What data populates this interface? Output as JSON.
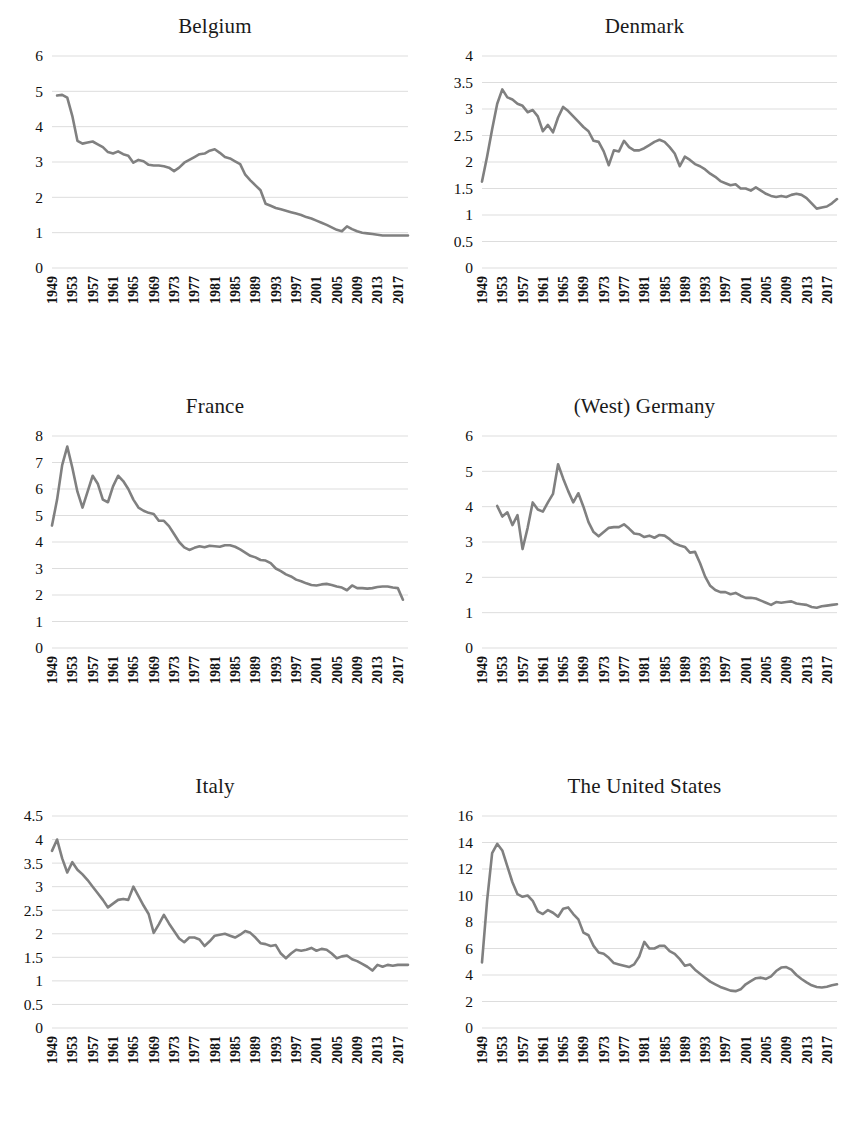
{
  "figure": {
    "layout": "2 columns x 3 rows of line charts",
    "line_color": "#808080",
    "grid_color": "#d9d9d9",
    "background": "#ffffff"
  },
  "chart_data": [
    {
      "type": "line",
      "title": "Belgium",
      "xlabel": "",
      "ylabel": "",
      "ylim": [
        0,
        6
      ],
      "ytick_step": 1,
      "yticks": [
        "0",
        "1",
        "2",
        "3",
        "4",
        "5",
        "6"
      ],
      "xlim": [
        1949,
        2019
      ],
      "xticks": [
        "1949",
        "1953",
        "1957",
        "1961",
        "1965",
        "1969",
        "1973",
        "1977",
        "1981",
        "1985",
        "1989",
        "1993",
        "1997",
        "2001",
        "2005",
        "2009",
        "2013",
        "2017"
      ],
      "grid": true,
      "legend": "none",
      "x": [
        1950,
        1951,
        1952,
        1953,
        1954,
        1955,
        1956,
        1957,
        1958,
        1959,
        1960,
        1961,
        1962,
        1963,
        1964,
        1965,
        1966,
        1967,
        1968,
        1969,
        1970,
        1971,
        1972,
        1973,
        1974,
        1975,
        1976,
        1977,
        1978,
        1979,
        1980,
        1981,
        1982,
        1983,
        1984,
        1985,
        1986,
        1987,
        1988,
        1989,
        1990,
        1991,
        1992,
        1993,
        1994,
        1995,
        1996,
        1997,
        1998,
        1999,
        2000,
        2001,
        2002,
        2003,
        2004,
        2005,
        2006,
        2007,
        2008,
        2009,
        2010,
        2011,
        2012,
        2013,
        2014,
        2015,
        2016,
        2017,
        2018,
        2019
      ],
      "values": [
        4.88,
        4.9,
        4.82,
        4.3,
        3.6,
        3.52,
        3.55,
        3.58,
        3.5,
        3.42,
        3.28,
        3.24,
        3.3,
        3.22,
        3.18,
        2.98,
        3.06,
        3.02,
        2.92,
        2.9,
        2.9,
        2.88,
        2.84,
        2.74,
        2.84,
        2.98,
        3.06,
        3.14,
        3.22,
        3.24,
        3.32,
        3.36,
        3.26,
        3.14,
        3.1,
        3.02,
        2.94,
        2.64,
        2.48,
        2.34,
        2.2,
        1.82,
        1.76,
        1.7,
        1.66,
        1.62,
        1.58,
        1.54,
        1.5,
        1.44,
        1.4,
        1.34,
        1.28,
        1.22,
        1.15,
        1.08,
        1.04,
        1.18,
        1.1,
        1.04,
        1.0,
        0.98,
        0.96,
        0.94,
        0.92,
        0.92,
        0.92,
        0.92,
        0.92,
        0.92
      ]
    },
    {
      "type": "line",
      "title": "Denmark",
      "xlabel": "",
      "ylabel": "",
      "ylim": [
        0,
        4
      ],
      "ytick_step": 0.5,
      "yticks": [
        "0",
        "0.5",
        "1",
        "1.5",
        "2",
        "2.5",
        "3",
        "3.5",
        "4"
      ],
      "xlim": [
        1949,
        2019
      ],
      "xticks": [
        "1949",
        "1953",
        "1957",
        "1961",
        "1965",
        "1969",
        "1973",
        "1977",
        "1981",
        "1985",
        "1989",
        "1993",
        "1997",
        "2001",
        "2005",
        "2009",
        "2013",
        "2017"
      ],
      "grid": true,
      "legend": "none",
      "x": [
        1949,
        1950,
        1951,
        1952,
        1953,
        1954,
        1955,
        1956,
        1957,
        1958,
        1959,
        1960,
        1961,
        1962,
        1963,
        1964,
        1965,
        1966,
        1967,
        1968,
        1969,
        1970,
        1971,
        1972,
        1973,
        1974,
        1975,
        1976,
        1977,
        1978,
        1979,
        1980,
        1981,
        1982,
        1983,
        1984,
        1985,
        1986,
        1987,
        1988,
        1989,
        1990,
        1991,
        1992,
        1993,
        1994,
        1995,
        1996,
        1997,
        1998,
        1999,
        2000,
        2001,
        2002,
        2003,
        2004,
        2005,
        2006,
        2007,
        2008,
        2009,
        2010,
        2011,
        2012,
        2013,
        2014,
        2015,
        2016,
        2017,
        2018,
        2019
      ],
      "values": [
        1.63,
        2.1,
        2.62,
        3.1,
        3.37,
        3.22,
        3.18,
        3.1,
        3.06,
        2.94,
        2.98,
        2.86,
        2.58,
        2.7,
        2.56,
        2.84,
        3.04,
        2.96,
        2.86,
        2.76,
        2.66,
        2.58,
        2.4,
        2.38,
        2.2,
        1.94,
        2.22,
        2.2,
        2.4,
        2.28,
        2.22,
        2.22,
        2.26,
        2.32,
        2.38,
        2.42,
        2.38,
        2.28,
        2.16,
        1.92,
        2.1,
        2.04,
        1.96,
        1.92,
        1.86,
        1.78,
        1.72,
        1.64,
        1.6,
        1.56,
        1.58,
        1.5,
        1.5,
        1.46,
        1.52,
        1.46,
        1.4,
        1.36,
        1.34,
        1.36,
        1.34,
        1.38,
        1.4,
        1.38,
        1.32,
        1.22,
        1.12,
        1.14,
        1.16,
        1.22,
        1.3
      ]
    },
    {
      "type": "line",
      "title": "France",
      "xlabel": "",
      "ylabel": "",
      "ylim": [
        0,
        8
      ],
      "ytick_step": 1,
      "yticks": [
        "0",
        "1",
        "2",
        "3",
        "4",
        "5",
        "6",
        "7",
        "8"
      ],
      "xlim": [
        1949,
        2019
      ],
      "xticks": [
        "1949",
        "1953",
        "1957",
        "1961",
        "1965",
        "1969",
        "1973",
        "1977",
        "1981",
        "1985",
        "1989",
        "1993",
        "1997",
        "2001",
        "2005",
        "2009",
        "2013",
        "2017"
      ],
      "grid": true,
      "legend": "none",
      "x": [
        1949,
        1950,
        1951,
        1952,
        1953,
        1954,
        1955,
        1956,
        1957,
        1958,
        1959,
        1960,
        1961,
        1962,
        1963,
        1964,
        1965,
        1966,
        1967,
        1968,
        1969,
        1970,
        1971,
        1972,
        1973,
        1974,
        1975,
        1976,
        1977,
        1978,
        1979,
        1980,
        1981,
        1982,
        1983,
        1984,
        1985,
        1986,
        1987,
        1988,
        1989,
        1990,
        1991,
        1992,
        1993,
        1994,
        1995,
        1996,
        1997,
        1998,
        1999,
        2000,
        2001,
        2002,
        2003,
        2004,
        2005,
        2006,
        2007,
        2008,
        2009,
        2010,
        2011,
        2012,
        2013,
        2014,
        2015,
        2016,
        2017,
        2018,
        2019
      ],
      "values": [
        4.62,
        5.6,
        6.9,
        7.6,
        6.8,
        5.9,
        5.3,
        5.9,
        6.5,
        6.2,
        5.6,
        5.5,
        6.1,
        6.5,
        6.3,
        6.0,
        5.6,
        5.3,
        5.18,
        5.1,
        5.06,
        4.8,
        4.8,
        4.6,
        4.3,
        4.0,
        3.8,
        3.7,
        3.78,
        3.84,
        3.8,
        3.86,
        3.84,
        3.82,
        3.88,
        3.88,
        3.82,
        3.72,
        3.6,
        3.48,
        3.42,
        3.32,
        3.3,
        3.2,
        3.0,
        2.9,
        2.78,
        2.7,
        2.58,
        2.52,
        2.44,
        2.38,
        2.36,
        2.4,
        2.42,
        2.38,
        2.32,
        2.28,
        2.18,
        2.36,
        2.26,
        2.26,
        2.24,
        2.26,
        2.3,
        2.32,
        2.32,
        2.28,
        2.26,
        1.82
      ]
    },
    {
      "type": "line",
      "title": "(West) Germany",
      "xlabel": "",
      "ylabel": "",
      "ylim": [
        0,
        6
      ],
      "ytick_step": 1,
      "yticks": [
        "0",
        "1",
        "2",
        "3",
        "4",
        "5",
        "6"
      ],
      "xlim": [
        1949,
        2019
      ],
      "xticks": [
        "1949",
        "1953",
        "1957",
        "1961",
        "1965",
        "1969",
        "1973",
        "1977",
        "1981",
        "1985",
        "1989",
        "1993",
        "1997",
        "2001",
        "2005",
        "2009",
        "2013",
        "2017"
      ],
      "grid": true,
      "legend": "none",
      "x": [
        1952,
        1953,
        1954,
        1955,
        1956,
        1957,
        1958,
        1959,
        1960,
        1961,
        1962,
        1963,
        1964,
        1965,
        1966,
        1967,
        1968,
        1969,
        1970,
        1971,
        1972,
        1973,
        1974,
        1975,
        1976,
        1977,
        1978,
        1979,
        1980,
        1981,
        1982,
        1983,
        1984,
        1985,
        1986,
        1987,
        1988,
        1989,
        1990,
        1991,
        1992,
        1993,
        1994,
        1995,
        1996,
        1997,
        1998,
        1999,
        2000,
        2001,
        2002,
        2003,
        2004,
        2005,
        2006,
        2007,
        2008,
        2009,
        2010,
        2011,
        2012,
        2013,
        2014,
        2015,
        2016,
        2017,
        2018,
        2019
      ],
      "values": [
        4.02,
        3.72,
        3.84,
        3.48,
        3.76,
        2.8,
        3.4,
        4.12,
        3.92,
        3.86,
        4.12,
        4.36,
        5.2,
        4.8,
        4.44,
        4.12,
        4.38,
        4.0,
        3.56,
        3.28,
        3.16,
        3.28,
        3.4,
        3.42,
        3.42,
        3.5,
        3.38,
        3.24,
        3.22,
        3.14,
        3.18,
        3.12,
        3.2,
        3.18,
        3.08,
        2.96,
        2.9,
        2.86,
        2.7,
        2.72,
        2.4,
        2.02,
        1.76,
        1.64,
        1.58,
        1.58,
        1.52,
        1.56,
        1.48,
        1.42,
        1.42,
        1.4,
        1.34,
        1.28,
        1.22,
        1.3,
        1.28,
        1.3,
        1.32,
        1.26,
        1.24,
        1.22,
        1.16,
        1.14,
        1.18,
        1.2,
        1.22,
        1.24
      ]
    },
    {
      "type": "line",
      "title": "Italy",
      "xlabel": "",
      "ylabel": "",
      "ylim": [
        0,
        4.5
      ],
      "ytick_step": 0.5,
      "yticks": [
        "0",
        "0.5",
        "1",
        "1.5",
        "2",
        "2.5",
        "3",
        "3.5",
        "4",
        "4.5"
      ],
      "xlim": [
        1949,
        2019
      ],
      "xticks": [
        "1949",
        "1953",
        "1957",
        "1961",
        "1965",
        "1969",
        "1973",
        "1977",
        "1981",
        "1985",
        "1989",
        "1993",
        "1997",
        "2001",
        "2005",
        "2009",
        "2013",
        "2017"
      ],
      "grid": true,
      "legend": "none",
      "x": [
        1949,
        1950,
        1951,
        1952,
        1953,
        1954,
        1955,
        1956,
        1957,
        1958,
        1959,
        1960,
        1961,
        1962,
        1963,
        1964,
        1965,
        1966,
        1967,
        1968,
        1969,
        1970,
        1971,
        1972,
        1973,
        1974,
        1975,
        1976,
        1977,
        1978,
        1979,
        1980,
        1981,
        1982,
        1983,
        1984,
        1985,
        1986,
        1987,
        1988,
        1989,
        1990,
        1991,
        1992,
        1993,
        1994,
        1995,
        1996,
        1997,
        1998,
        1999,
        2000,
        2001,
        2002,
        2003,
        2004,
        2005,
        2006,
        2007,
        2008,
        2009,
        2010,
        2011,
        2012,
        2013,
        2014,
        2015,
        2016,
        2017,
        2018,
        2019
      ],
      "values": [
        3.76,
        4.0,
        3.6,
        3.3,
        3.52,
        3.36,
        3.26,
        3.14,
        3.0,
        2.86,
        2.72,
        2.56,
        2.64,
        2.72,
        2.74,
        2.72,
        3.0,
        2.8,
        2.6,
        2.42,
        2.02,
        2.2,
        2.4,
        2.22,
        2.06,
        1.9,
        1.82,
        1.92,
        1.92,
        1.88,
        1.74,
        1.84,
        1.96,
        1.98,
        2.0,
        1.96,
        1.92,
        1.98,
        2.06,
        2.02,
        1.92,
        1.8,
        1.78,
        1.74,
        1.76,
        1.58,
        1.48,
        1.58,
        1.66,
        1.64,
        1.66,
        1.7,
        1.64,
        1.68,
        1.66,
        1.58,
        1.48,
        1.52,
        1.54,
        1.46,
        1.42,
        1.36,
        1.3,
        1.22,
        1.34,
        1.3,
        1.34,
        1.32,
        1.34,
        1.34,
        1.34
      ]
    },
    {
      "type": "line",
      "title": "The United States",
      "xlabel": "",
      "ylabel": "",
      "ylim": [
        0,
        16
      ],
      "ytick_step": 2,
      "yticks": [
        "0",
        "2",
        "4",
        "6",
        "8",
        "10",
        "12",
        "14",
        "16"
      ],
      "xlim": [
        1949,
        2019
      ],
      "xticks": [
        "1949",
        "1953",
        "1957",
        "1961",
        "1965",
        "1969",
        "1973",
        "1977",
        "1981",
        "1985",
        "1989",
        "1993",
        "1997",
        "2001",
        "2005",
        "2009",
        "2013",
        "2017"
      ],
      "grid": true,
      "legend": "none",
      "x": [
        1949,
        1950,
        1951,
        1952,
        1953,
        1954,
        1955,
        1956,
        1957,
        1958,
        1959,
        1960,
        1961,
        1962,
        1963,
        1964,
        1965,
        1966,
        1967,
        1968,
        1969,
        1970,
        1971,
        1972,
        1973,
        1974,
        1975,
        1976,
        1977,
        1978,
        1979,
        1980,
        1981,
        1982,
        1983,
        1984,
        1985,
        1986,
        1987,
        1988,
        1989,
        1990,
        1991,
        1992,
        1993,
        1994,
        1995,
        1996,
        1997,
        1998,
        1999,
        2000,
        2001,
        2002,
        2003,
        2004,
        2005,
        2006,
        2007,
        2008,
        2009,
        2010,
        2011,
        2012,
        2013,
        2014,
        2015,
        2016,
        2017,
        2018,
        2019
      ],
      "values": [
        4.95,
        9.6,
        13.2,
        13.9,
        13.4,
        12.2,
        11.0,
        10.1,
        9.9,
        10.0,
        9.6,
        8.8,
        8.6,
        8.9,
        8.7,
        8.4,
        9.0,
        9.1,
        8.6,
        8.2,
        7.2,
        7.0,
        6.2,
        5.7,
        5.6,
        5.3,
        4.9,
        4.8,
        4.7,
        4.6,
        4.8,
        5.4,
        6.5,
        6.0,
        6.0,
        6.2,
        6.2,
        5.8,
        5.6,
        5.2,
        4.7,
        4.8,
        4.4,
        4.1,
        3.8,
        3.5,
        3.3,
        3.1,
        2.96,
        2.82,
        2.78,
        2.92,
        3.3,
        3.54,
        3.76,
        3.8,
        3.7,
        3.9,
        4.3,
        4.56,
        4.6,
        4.4,
        4.0,
        3.7,
        3.44,
        3.22,
        3.1,
        3.06,
        3.12,
        3.22,
        3.3
      ]
    }
  ]
}
